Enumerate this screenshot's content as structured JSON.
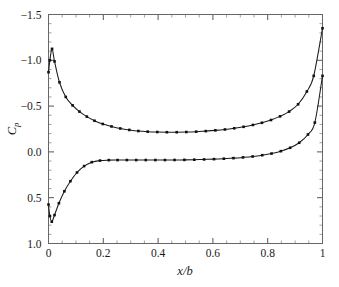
{
  "chart_data": {
    "type": "line",
    "title": "",
    "subtitle": "",
    "xlabel": "x/b",
    "ylabel": "Cp",
    "ylabel_base": "C",
    "ylabel_sub": "p",
    "xlim": [
      0,
      1
    ],
    "ylim": [
      1.0,
      -1.5
    ],
    "y_axis_inverted": true,
    "grid": false,
    "legend": false,
    "legend_position": "none",
    "marker": "square",
    "line_color": "#1a1a1a",
    "marker_color": "#101010",
    "background_color": "#ffffff",
    "frame_color": "#666666",
    "xticks": [
      0,
      0.2,
      0.4,
      0.6,
      0.8,
      1
    ],
    "xticklabels": [
      "0",
      "0.2",
      "0.4",
      "0.6",
      "0.8",
      "1"
    ],
    "x_minor_step": 0.05,
    "yticks": [
      -1.5,
      -1.0,
      -0.5,
      0.0,
      0.5,
      1.0
    ],
    "yticklabels": [
      "−1.5",
      "−1.0",
      "−0.5",
      "0.0",
      "0.5",
      "1.0"
    ],
    "y_minor_step": 0.1,
    "series": [
      {
        "name": "suction-surface",
        "x": [
          0.0,
          0.005,
          0.013,
          0.022,
          0.04,
          0.063,
          0.088,
          0.113,
          0.14,
          0.168,
          0.198,
          0.23,
          0.262,
          0.295,
          0.328,
          0.362,
          0.397,
          0.432,
          0.468,
          0.503,
          0.539,
          0.574,
          0.609,
          0.644,
          0.678,
          0.712,
          0.746,
          0.779,
          0.812,
          0.845,
          0.878,
          0.911,
          0.943,
          0.968,
          1.0
        ],
        "y": [
          -0.87,
          -1.0,
          -1.125,
          -0.988,
          -0.76,
          -0.6,
          -0.508,
          -0.44,
          -0.385,
          -0.34,
          -0.305,
          -0.278,
          -0.256,
          -0.24,
          -0.228,
          -0.221,
          -0.217,
          -0.215,
          -0.215,
          -0.217,
          -0.221,
          -0.227,
          -0.235,
          -0.245,
          -0.258,
          -0.274,
          -0.294,
          -0.318,
          -0.348,
          -0.388,
          -0.44,
          -0.52,
          -0.66,
          -0.83,
          -1.35
        ]
      },
      {
        "name": "pressure-surface",
        "x": [
          0.0,
          0.005,
          0.012,
          0.022,
          0.038,
          0.058,
          0.08,
          0.104,
          0.13,
          0.158,
          0.188,
          0.22,
          0.252,
          0.286,
          0.32,
          0.355,
          0.39,
          0.425,
          0.46,
          0.496,
          0.532,
          0.568,
          0.604,
          0.64,
          0.675,
          0.71,
          0.745,
          0.78,
          0.814,
          0.848,
          0.882,
          0.915,
          0.947,
          0.972,
          1.0
        ],
        "y": [
          0.575,
          0.7,
          0.762,
          0.69,
          0.56,
          0.43,
          0.32,
          0.225,
          0.155,
          0.112,
          0.095,
          0.09,
          0.089,
          0.089,
          0.089,
          0.089,
          0.089,
          0.089,
          0.088,
          0.087,
          0.085,
          0.082,
          0.079,
          0.074,
          0.068,
          0.06,
          0.05,
          0.036,
          0.018,
          -0.008,
          -0.045,
          -0.1,
          -0.19,
          -0.32,
          -0.83
        ]
      }
    ]
  },
  "axes": {
    "x_axis_name": "x-over-b-axis",
    "y_axis_name": "cp-axis"
  }
}
